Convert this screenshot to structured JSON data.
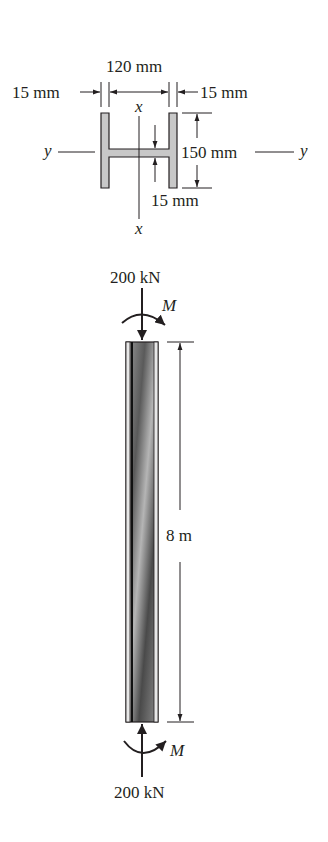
{
  "figure": {
    "cross_section": {
      "width_label": "120 mm",
      "left_flange_label": "15 mm",
      "right_flange_label": "15 mm",
      "height_label": "150 mm",
      "web_label": "15 mm",
      "axis_x_top": "x",
      "axis_x_bottom": "x",
      "axis_y_left": "y",
      "axis_y_right": "y",
      "fill_color": "#c8c8c8"
    },
    "column": {
      "top_load_label": "200 kN",
      "top_moment_label": "M",
      "bottom_load_label": "200 kN",
      "bottom_moment_label": "M",
      "length_label": "8 m"
    }
  }
}
